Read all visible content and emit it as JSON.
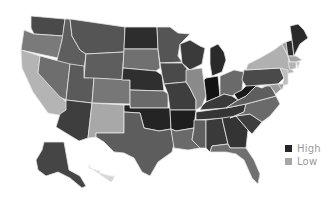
{
  "map": {
    "type": "choropleth",
    "region": "United States",
    "colors": {
      "high": "#262626",
      "low": "#a6a6a6",
      "background": "#ffffff",
      "border": "#e6e6e6"
    },
    "states": [
      {
        "code": "WA",
        "shade": "#4a4a4a",
        "points": "31,16 65,19 63,36 34,34 31,28"
      },
      {
        "code": "OR",
        "shade": "#7a7a7a",
        "points": "24,30 34,34 63,36 58,58 21,50"
      },
      {
        "code": "CA",
        "shade": "#b4b4b4",
        "points": "21,50 40,56 38,73 68,104 64,116 48,113 33,92 22,68"
      },
      {
        "code": "ID",
        "shade": "#5e5e5e",
        "points": "65,19 70,19 72,36 80,50 86,54 84,70 56,64 62,40"
      },
      {
        "code": "NV",
        "shade": "#6e6e6e",
        "points": "40,56 70,64 66,100 60,97 38,73"
      },
      {
        "code": "MT",
        "shade": "#555555",
        "points": "70,19 125,27 124,52 86,54 80,50 72,36"
      },
      {
        "code": "WY",
        "shade": "#5e5e5e",
        "points": "86,54 124,52 122,80 84,78"
      },
      {
        "code": "UT",
        "shade": "#5a5a5a",
        "points": "70,64 84,66 84,78 94,78 92,103 66,100"
      },
      {
        "code": "AZ",
        "shade": "#3e3e3e",
        "points": "66,100 92,103 88,138 79,141 56,127 60,114 66,110"
      },
      {
        "code": "CO",
        "shade": "#777777",
        "points": "94,78 130,80 130,104 92,103"
      },
      {
        "code": "NM",
        "shade": "#a8a8a8",
        "points": "92,103 124,105 124,133 96,133 96,137 88,138"
      },
      {
        "code": "ND",
        "shade": "#2d2d2d",
        "points": "125,27 157,27 158,49 124,49"
      },
      {
        "code": "SD",
        "shade": "#707070",
        "points": "124,49 158,49 160,68 156,71 123,68"
      },
      {
        "code": "NE",
        "shade": "#2f2f2f",
        "points": "123,68 156,71 162,75 164,91 130,90 130,80 122,80"
      },
      {
        "code": "KS",
        "shade": "#6a6a6a",
        "points": "130,90 164,91 168,94 168,108 130,108"
      },
      {
        "code": "OK",
        "shade": "#242424",
        "points": "124,105 130,105 130,108 170,108 171,129 159,131 144,128 140,113 124,112"
      },
      {
        "code": "TX",
        "shade": "#5d5d5d",
        "points": "124,112 140,113 144,128 159,131 171,129 174,144 172,152 158,162 150,176 142,172 134,158 124,153 114,152 104,142 96,137 96,133 124,133"
      },
      {
        "code": "MN",
        "shade": "#555555",
        "points": "157,27 170,27 178,33 190,34 180,44 178,56 182,62 160,63 158,49"
      },
      {
        "code": "IA",
        "shade": "#4a4a4a",
        "points": "160,63 182,63 188,70 186,82 164,84 162,75"
      },
      {
        "code": "MO",
        "shade": "#3e3e3e",
        "points": "164,84 186,82 190,88 196,100 196,110 170,110 168,94"
      },
      {
        "code": "AR",
        "shade": "#1e1e1e",
        "points": "170,110 196,110 194,128 176,131 171,129"
      },
      {
        "code": "LA",
        "shade": "#6a6a6a",
        "points": "171,129 176,131 194,128 192,140 200,148 188,150 174,148"
      },
      {
        "code": "WI",
        "shade": "#3a3a3a",
        "points": "180,44 190,40 200,46 205,48 202,64 190,70 182,63"
      },
      {
        "code": "IL",
        "shade": "#8a8a8a",
        "points": "186,70 202,68 206,96 202,106 196,110 196,100 190,88 186,82"
      },
      {
        "code": "MI",
        "shade": "#2a2a2a",
        "points": "210,48 218,44 224,52 226,60 222,72 212,76 210,64"
      },
      {
        "code": "IN",
        "shade": "#141414",
        "points": "206,78 218,76 220,96 206,102 206,96 204,80"
      },
      {
        "code": "OH",
        "shade": "#6a6a6a",
        "points": "220,76 234,70 244,72 242,90 232,96 224,94 220,96"
      },
      {
        "code": "KY",
        "shade": "#3a3a3a",
        "points": "202,106 206,102 220,96 224,94 232,96 238,100 226,108 200,110"
      },
      {
        "code": "TN",
        "shade": "#353535",
        "points": "196,112 226,108 246,104 244,112 230,118 196,120"
      },
      {
        "code": "MS",
        "shade": "#606060",
        "points": "194,120 206,120 206,148 200,148 192,140 194,128"
      },
      {
        "code": "AL",
        "shade": "#3a3a3a",
        "points": "206,120 222,118 228,144 212,146 210,152 206,148"
      },
      {
        "code": "GA",
        "shade": "#343434",
        "points": "222,118 236,116 248,130 246,148 230,148 228,144"
      },
      {
        "code": "FL",
        "shade": "#707070",
        "points": "210,152 212,146 228,144 230,148 246,148 254,160 260,174 258,184 252,178 244,160 236,154 226,152"
      },
      {
        "code": "SC",
        "shade": "#3e3e3e",
        "points": "236,116 250,114 262,122 252,134 248,130"
      },
      {
        "code": "NC",
        "shade": "#6a6a6a",
        "points": "246,104 276,96 280,104 270,116 262,122 250,114 236,116 230,118 244,112"
      },
      {
        "code": "VA",
        "shade": "#5e5e5e",
        "points": "238,100 246,96 256,86 262,88 270,84 276,96 246,104 226,108"
      },
      {
        "code": "WV",
        "shade": "#1a1a1a",
        "points": "242,90 248,84 256,80 262,84 256,86 246,96 238,100 234,94"
      },
      {
        "code": "PA",
        "shade": "#4a4a4a",
        "points": "244,70 280,68 284,78 278,84 246,86 242,80"
      },
      {
        "code": "NY",
        "shade": "#b0b0b0",
        "points": "248,64 260,58 274,50 282,44 288,56 290,68 294,72 286,74 280,68 246,70"
      },
      {
        "code": "NJ",
        "shade": "#bdbdbd",
        "points": "280,68 288,70 288,84 282,86 284,78"
      },
      {
        "code": "MD",
        "shade": "#9a9a9a",
        "points": "262,86 278,84 282,88 276,94 270,86"
      },
      {
        "code": "DE",
        "shade": "#a0a0a0",
        "points": "278,84 284,84 282,90"
      },
      {
        "code": "VT",
        "shade": "#9c9c9c",
        "points": "282,44 286,42 288,56"
      },
      {
        "code": "NH",
        "shade": "#2e2e2e",
        "points": "286,42 292,40 294,56 288,56"
      },
      {
        "code": "ME",
        "shade": "#2a2a2a",
        "points": "290,26 298,24 304,30 308,38 300,44 294,56 292,40"
      },
      {
        "code": "MA",
        "shade": "#a4a4a4",
        "points": "288,56 296,56 302,60 296,62 290,62"
      },
      {
        "code": "CT",
        "shade": "#b4b4b4",
        "points": "288,62 296,62 296,68 290,70"
      },
      {
        "code": "RI",
        "shade": "#c4c4c4",
        "points": "296,62 300,62 298,68"
      },
      {
        "code": "AK",
        "shade": "#454545",
        "points": "44,142 64,142 69,170 80,176 86,186 82,188 70,178 58,172 46,176 38,170 36,160 42,150"
      },
      {
        "code": "HI",
        "shade": "#d6d6d6",
        "points": "88,166 90,166 89,168 98,171 100,171 99,173 110,176 114,176 113,180 111,182"
      }
    ]
  },
  "legend": {
    "items": [
      {
        "label": "High",
        "color": "#262626"
      },
      {
        "label": "Low",
        "color": "#a6a6a6"
      }
    ]
  }
}
